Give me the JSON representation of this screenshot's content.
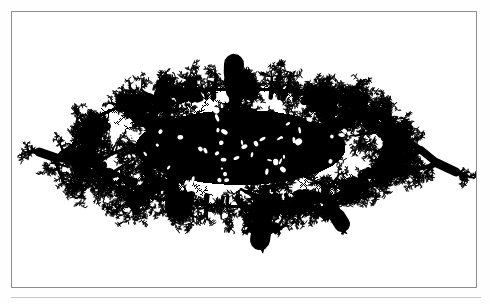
{
  "figure": {
    "caption": "",
    "background_color": "#ffffff",
    "ink_color": "#000000",
    "frame": {
      "border_color": "#8e8e8e",
      "border_width_px": 1,
      "x": 11,
      "y": 11,
      "width": 466,
      "height": 277
    },
    "baseline_rule": {
      "color": "#c9c9c9",
      "x": 11,
      "y": 297,
      "width": 470
    }
  },
  "chart_data": {
    "type": "scatter",
    "subtitle": "",
    "xlabel": "",
    "ylabel": "",
    "xlim": [
      0,
      466
    ],
    "ylim": [
      0,
      277
    ],
    "grid": false,
    "legend_position": "none",
    "annotations": [],
    "tick_labels": {
      "x": [],
      "y": []
    },
    "series": [
      {
        "name": "aggregate-cluster",
        "color": "#000000",
        "description": "Dense dendritic black mass, elongated left-to-right with feathery branching tendrils tapering to points at both ends.",
        "bounds": {
          "x_min": 25,
          "y_min": 47,
          "x_max": 447,
          "y_max": 234
        },
        "core": {
          "cx": 228,
          "cy": 135,
          "rx": 150,
          "ry": 52
        },
        "seed": 20250614,
        "particle_count": 30000,
        "anisotropy_x": 2.85,
        "anisotropy_y": 1.0,
        "tendrils": [
          {
            "name": "far-left-tip",
            "x": 27,
            "y": 140,
            "angle_deg": 196,
            "length": 96,
            "thickness": 9
          },
          {
            "name": "left-upper-branch",
            "x": 120,
            "y": 100,
            "angle_deg": 206,
            "length": 72,
            "thickness": 13
          },
          {
            "name": "left-lower-branch",
            "x": 132,
            "y": 182,
            "angle_deg": 152,
            "length": 58,
            "thickness": 12
          },
          {
            "name": "top-crown",
            "x": 222,
            "y": 52,
            "angle_deg": 272,
            "length": 46,
            "thickness": 20
          },
          {
            "name": "top-left-spur",
            "x": 152,
            "y": 76,
            "angle_deg": 292,
            "length": 40,
            "thickness": 15
          },
          {
            "name": "top-right-spur",
            "x": 300,
            "y": 80,
            "angle_deg": 258,
            "length": 38,
            "thickness": 15
          },
          {
            "name": "bottom-center-lobe",
            "x": 248,
            "y": 228,
            "angle_deg": 84,
            "length": 52,
            "thickness": 20
          },
          {
            "name": "bottom-left-lobe",
            "x": 160,
            "y": 196,
            "angle_deg": 104,
            "length": 42,
            "thickness": 15
          },
          {
            "name": "bottom-right-lobe",
            "x": 330,
            "y": 212,
            "angle_deg": 70,
            "length": 44,
            "thickness": 16
          },
          {
            "name": "right-upper-branch",
            "x": 336,
            "y": 110,
            "angle_deg": 342,
            "length": 66,
            "thickness": 13
          },
          {
            "name": "far-right-tip",
            "x": 444,
            "y": 160,
            "angle_deg": 18,
            "length": 104,
            "thickness": 9
          }
        ]
      }
    ]
  }
}
